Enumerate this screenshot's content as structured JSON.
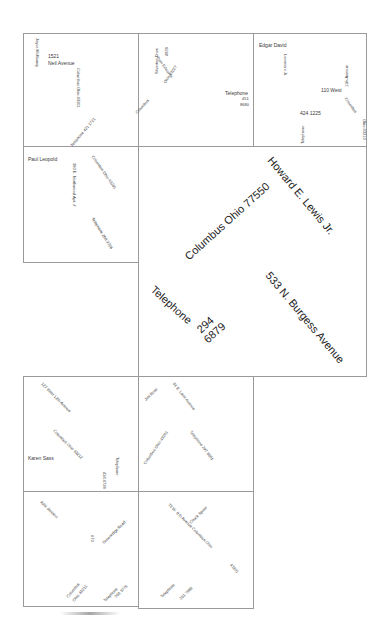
{
  "document": {
    "description": "Card layout of names, addresses and telephone numbers in rotated text",
    "cells": {
      "c1": {
        "name": "Joyce McKinney",
        "street_number": "1521",
        "street": "Neil Avenue",
        "city": "Columbus Ohio 43201",
        "telephone": "Telephone 421 1721"
      },
      "c2": {
        "street": "Silverton Drive",
        "street_number": "4839",
        "name": "Pam Edwards",
        "city_state": "Ohio 43227",
        "city": "Columbus",
        "telephone_label": "Telephone",
        "telephone_1": "451",
        "telephone_2": "8680"
      },
      "c3": {
        "name": "Edgar David",
        "name_suffix": "Lemmers Jr.",
        "street_number": "110 West",
        "street": "11th Avenue",
        "city": "Columbus",
        "state_zip": "Ohio 43210",
        "phone_number": "424 1225",
        "telephone_label": "Telephone"
      },
      "c4": {
        "name": "Paul Leopold",
        "street": "380 E. Northwood Apt. #",
        "city": "Columbus Ohio 43201",
        "telephone": "Telephone 268 3726"
      },
      "c5": {
        "city": "Columbus  Ohio 77550",
        "name": "Howard E. Lewis Jr.",
        "street": "533 N. Burgess Avenue",
        "telephone_label": "Telephone",
        "telephone_1": "294",
        "telephone_2": "6879"
      },
      "c6": {
        "street": "127 West 12th Avenue",
        "city": "Columbus Ohio 43212",
        "name": "Karen Sass",
        "telephone_label": "Telephone",
        "telephone_number": "424 4728"
      },
      "c7": {
        "name": "Jim Rose",
        "street": "81 E. Lane Avenue",
        "city": "Columbus Ohio 43201",
        "telephone": "Telephone 297 8881"
      },
      "c8": {
        "name": "Julia Jenison",
        "street_number": "#70",
        "street": "Greenridge Road",
        "city": "Columbus",
        "state_zip": "Ohio 43211",
        "telephone_label": "Telephone",
        "telephone_number": "268 3776"
      },
      "c9": {
        "name": "Chuck Speer",
        "street": "76 W. 8 th Avenue Columbus Ohio",
        "zip": "43201",
        "telephone_label": "Telephone",
        "telephone_number": "291 7988"
      }
    }
  }
}
